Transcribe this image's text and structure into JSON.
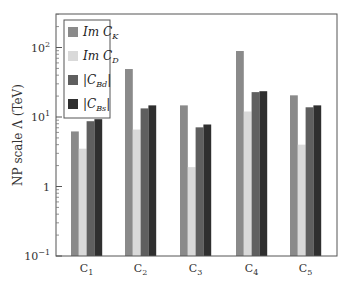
{
  "chart_data": {
    "type": "bar",
    "title": "",
    "xlabel": "",
    "ylabel": "NP scale Λ (TeV)",
    "yscale": "log",
    "ylim": [
      0.1,
      300
    ],
    "yticks": [
      {
        "value": 0.1,
        "label": "10",
        "sup": "−1"
      },
      {
        "value": 1,
        "label": "1",
        "sup": ""
      },
      {
        "value": 10,
        "label": "10",
        "sup": "1"
      },
      {
        "value": 100,
        "label": "10",
        "sup": "2"
      }
    ],
    "categories": [
      "C1",
      "C2",
      "C3",
      "C4",
      "C5"
    ],
    "category_labels": [
      {
        "base": "C",
        "sub": "1"
      },
      {
        "base": "C",
        "sub": "2"
      },
      {
        "base": "C",
        "sub": "3"
      },
      {
        "base": "C",
        "sub": "4"
      },
      {
        "base": "C",
        "sub": "5"
      }
    ],
    "series": [
      {
        "name": "Im C_K",
        "label_main": "Im C",
        "label_sub": "K",
        "abs": false,
        "color": "#8a8a8a",
        "values": [
          6.2,
          49,
          14.7,
          89,
          20.5
        ]
      },
      {
        "name": "Im C_D",
        "label_main": "Im C",
        "label_sub": "D",
        "abs": false,
        "color": "#d9d9d9",
        "values": [
          3.5,
          6.6,
          1.9,
          12,
          4.0
        ]
      },
      {
        "name": "|C_Bd|",
        "label_main": "C",
        "label_sub": "Bd",
        "abs": true,
        "color": "#5f5f5f",
        "values": [
          8.7,
          13.3,
          7.1,
          22.8,
          13.8
        ]
      },
      {
        "name": "|C_Bs|",
        "label_main": "C",
        "label_sub": "Bs",
        "abs": true,
        "color": "#2f2f2f",
        "values": [
          9.3,
          14.7,
          7.8,
          23.5,
          14.7
        ]
      }
    ],
    "grid": false,
    "legend_position": "upper left"
  }
}
